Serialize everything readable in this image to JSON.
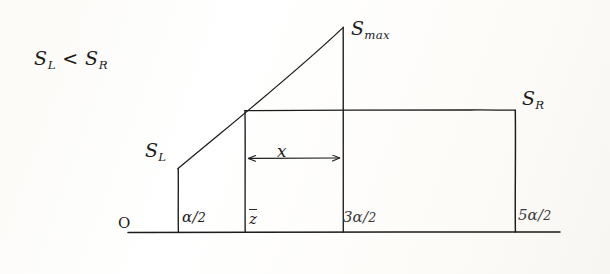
{
  "figure": {
    "kind": "hand-drawn-sketch",
    "background_color": "#fdfdfb",
    "ink_color": "#1b1b1b",
    "width": 610,
    "height": 274
  },
  "annotations": {
    "inequality": "S",
    "inequality_sub_left": "L",
    "inequality_mid": " < ",
    "inequality_right": "S",
    "inequality_sub_right": "R",
    "s_max": "S",
    "s_max_sub": "max",
    "s_right": "S",
    "s_right_sub": "R",
    "s_left": "S",
    "s_left_sub": "L",
    "width_label": "x",
    "origin": "O"
  },
  "axis_ticks": [
    {
      "name": "alpha-over-2",
      "num": "α",
      "slash": "/",
      "den": "2"
    },
    {
      "name": "z-bar",
      "text": "z"
    },
    {
      "name": "three-alpha-over-2",
      "num": "3α",
      "slash": "/",
      "den": "2"
    },
    {
      "name": "five-alpha-over-2",
      "num": "5α",
      "slash": "/",
      "den": "2"
    }
  ],
  "geometry": {
    "baseline_y": 232,
    "baseline_x_start": 128,
    "baseline_x_end": 560,
    "verticals_x": [
      178,
      245,
      343,
      515
    ],
    "plateau_y": 110,
    "peak": {
      "x": 343,
      "y": 27
    },
    "s_left_corner": {
      "x": 178,
      "y": 168
    },
    "arrow_y": 158,
    "arrow_x_start": 246,
    "arrow_x_end": 342
  }
}
